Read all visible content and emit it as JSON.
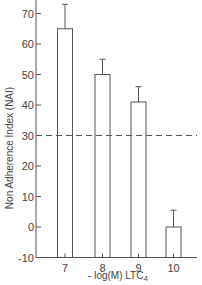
{
  "chart_data": {
    "type": "bar",
    "title": "",
    "ylabel": "Non  Adherence  Index  (NAI)",
    "xlabel": "- log(M)  LTC",
    "xlabel_subscript": "4",
    "categories": [
      "7",
      "8",
      "9",
      "10"
    ],
    "values": [
      65,
      50,
      41,
      0
    ],
    "error_upper": [
      73,
      55,
      46,
      5.5
    ],
    "ylim": [
      -10,
      75
    ],
    "yticks": [
      -10,
      0,
      10,
      20,
      30,
      40,
      50,
      60,
      70
    ],
    "ytick_labels": [
      "-10",
      "0",
      "10",
      "20",
      "30",
      "40",
      "50",
      "60",
      "70"
    ],
    "reference_line": {
      "y": 30,
      "style": "dashed"
    },
    "grid": false,
    "legend": null
  }
}
